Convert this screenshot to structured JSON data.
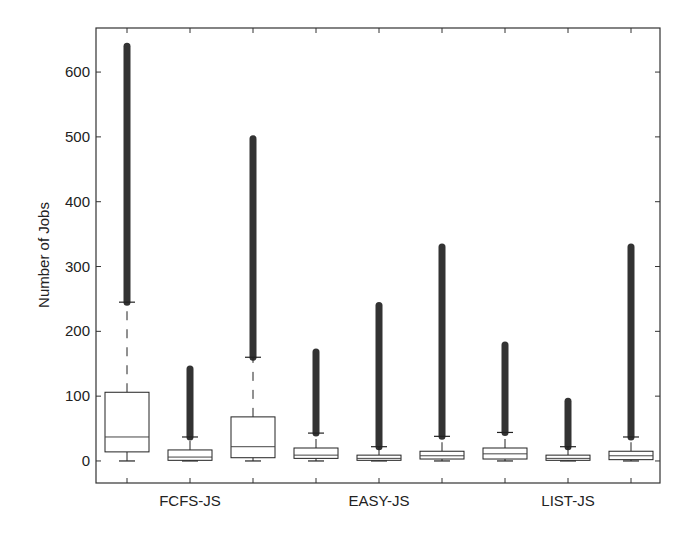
{
  "chart_data": {
    "type": "box",
    "title": "",
    "xlabel": "",
    "ylabel": "Number of Jobs",
    "ylim": [
      -34,
      668
    ],
    "yticks": [
      0,
      100,
      200,
      300,
      400,
      500,
      600
    ],
    "grid": false,
    "legend": null,
    "groups": [
      "FCFS-JS",
      "EASY-JS",
      "LIST-JS"
    ],
    "boxes": [
      {
        "group": "FCFS-JS",
        "index": 1,
        "whisker_low": 0,
        "q1": 14,
        "median": 37,
        "q3": 106,
        "whisker_high": 245,
        "outliers_range": [
          245,
          640
        ]
      },
      {
        "group": "FCFS-JS",
        "index": 2,
        "whisker_low": 0,
        "q1": 1,
        "median": 6,
        "q3": 17,
        "whisker_high": 37,
        "outliers_range": [
          37,
          142
        ]
      },
      {
        "group": "FCFS-JS",
        "index": 3,
        "whisker_low": 0,
        "q1": 5,
        "median": 22,
        "q3": 68,
        "whisker_high": 160,
        "outliers_range": [
          160,
          497
        ]
      },
      {
        "group": "EASY-JS",
        "index": 1,
        "whisker_low": 0,
        "q1": 4,
        "median": 9,
        "q3": 20,
        "whisker_high": 43,
        "outliers_range": [
          43,
          168
        ]
      },
      {
        "group": "EASY-JS",
        "index": 2,
        "whisker_low": 0,
        "q1": 1,
        "median": 4,
        "q3": 9,
        "whisker_high": 22,
        "outliers_range": [
          22,
          240
        ]
      },
      {
        "group": "EASY-JS",
        "index": 3,
        "whisker_low": 0,
        "q1": 3,
        "median": 8,
        "q3": 15,
        "whisker_high": 38,
        "outliers_range": [
          38,
          330
        ]
      },
      {
        "group": "LIST-JS",
        "index": 1,
        "whisker_low": 0,
        "q1": 3,
        "median": 11,
        "q3": 20,
        "whisker_high": 44,
        "outliers_range": [
          44,
          179
        ]
      },
      {
        "group": "LIST-JS",
        "index": 2,
        "whisker_low": 0,
        "q1": 1,
        "median": 4,
        "q3": 9,
        "whisker_high": 22,
        "outliers_range": [
          22,
          92
        ]
      },
      {
        "group": "LIST-JS",
        "index": 3,
        "whisker_low": 0,
        "q1": 2,
        "median": 8,
        "q3": 15,
        "whisker_high": 37,
        "outliers_range": [
          37,
          330
        ]
      }
    ]
  }
}
